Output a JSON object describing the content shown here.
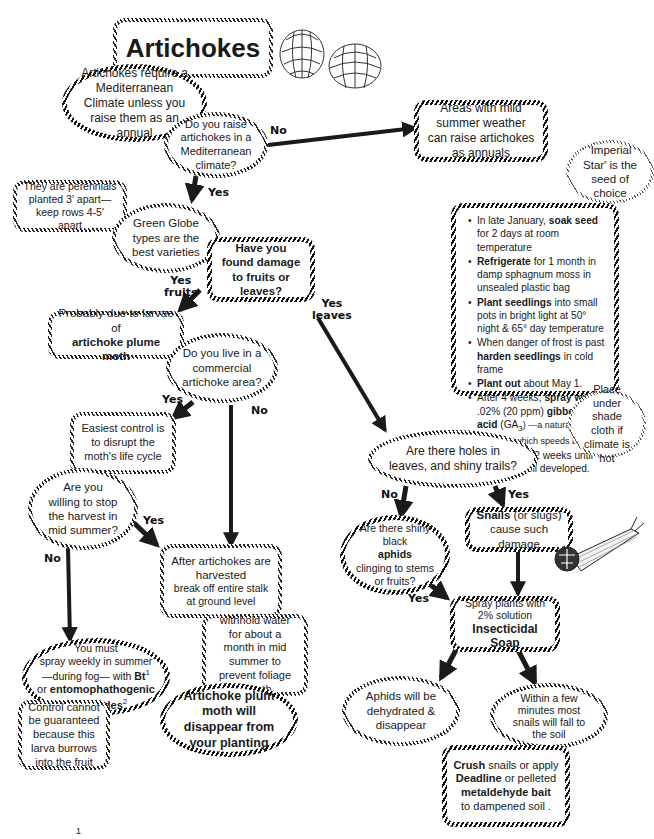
{
  "title": "Artichokes",
  "nodes": {
    "climate_note": "Artichokes require a Mediterranean Climate unless you raise them as an annual",
    "q_mediterranean": "Do you raise artichokes in a Mediterranean climate?",
    "mild_summer": "Areas with mild summer weather can raise artichokes as annuals",
    "imperial_star": "'Imperial Star' is the seed of choice",
    "perennials": "They are perennials planted 3' apart— keep rows 4-5' apart",
    "green_globe": "Green Globe types are the best varieties",
    "q_damage": "Have you found damage to fruits or leaves?",
    "plume_moth": {
      "line1": "Probably due to larvae of",
      "line2": "artichoke plume moth"
    },
    "q_commercial": "Do you live in a commercial artichoke area?",
    "easiest_control": "Easiest control is to disrupt the moth's life cycle",
    "q_stop_harvest": "Are you willing to stop the harvest in mid summer?",
    "after_harvest": {
      "line1": "After artichokes are harvested",
      "line2": "break off entire stalk at ground level"
    },
    "withhold_water": "withhold water for about a month in mid summer to prevent foliage growth",
    "moth_disappear": "Artichoke plum moth will disappear from your planting",
    "spray_weekly": {
      "line1": "You must",
      "line2": "spray weekly in summer",
      "line3_pre": "—during fog— with",
      "bt": "Bt",
      "bt_sup": "1",
      "line4_pre": "or",
      "nematodes": "entomophathogenic nematodes",
      "nematodes_sup": "2"
    },
    "no_guarantee": "Control cannot be guaranteed because this larva burrows into the fruit",
    "q_holes": "Are there holes in leaves, and shiny trails?",
    "q_aphids": {
      "pre": "Are there shiny black",
      "bold": "aphids",
      "post": "clinging to stems or fruits?"
    },
    "snails": {
      "bold": "Snails",
      "rest": "(or slugs) cause such damage"
    },
    "soap": {
      "line1": "Spray plants with 2% solution",
      "bold": "Insecticidal Soap"
    },
    "aphids_dehydrated": "Aphids will be dehydrated & disappear",
    "snails_fall": "Within a few minutes most snails will fall to the soil",
    "crush": {
      "b1": "Crush",
      "t1": "snails or apply",
      "b2": "Deadline",
      "t2": "or pelleted",
      "b3": "metaldehyde bait",
      "t3": "to dampened soil ."
    },
    "shade_cloth": "Place under shade cloth if climate is hot"
  },
  "seed_steps": [
    {
      "pre": "In late January,",
      "bold": "soak seed",
      "post": "for 2 days at room temperature"
    },
    {
      "pre": "",
      "bold": "Refrigerate",
      "post": "for 1 month in damp sphagnum moss in unsealed plastic bag"
    },
    {
      "pre": "",
      "bold": "Plant seedlings",
      "post": "into small pots in bright light at 50° night & 65° day temperature"
    },
    {
      "pre": "When danger of frost is past",
      "bold": "harden seedlings",
      "post": "in cold frame"
    },
    {
      "pre": "",
      "bold": "Plant out",
      "post": "about May 1."
    },
    {
      "pre": "After 4 weeks,",
      "bold": "spray with",
      "post": ".02% (20 ppm)",
      "bold2": "gibberellic acid",
      "post2": "(GA",
      "sub": "3",
      "post3": ") —a natural plant hormone which speeds budding"
    },
    {
      "pre": "Spray every 2 weeks until buds are well developed.",
      "bold": "",
      "post": ""
    }
  ],
  "edge_labels": {
    "no_1": "No",
    "yes_1": "Yes",
    "yes_fruits": "Yes\nfruits",
    "yes_leaves": "Yes\nleaves",
    "yes_2": "Yes",
    "no_2": "No",
    "yes_3": "Yes",
    "no_3": "No",
    "no_4": "No",
    "yes_4": "Yes",
    "yes_5": "Yes"
  },
  "illustrations": [
    "artichoke-icon",
    "artichoke-icon",
    "snail-icon"
  ],
  "footnote_marker": "1"
}
